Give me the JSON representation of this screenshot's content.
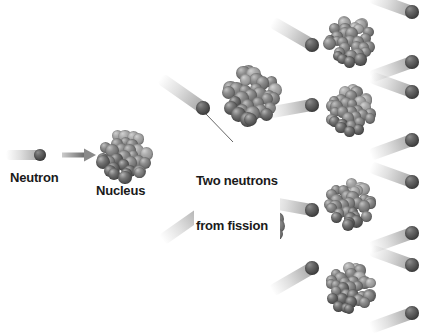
{
  "figure": {
    "background_color": "#ffffff",
    "width": 435,
    "height": 336
  },
  "palette": {
    "neutron_dark": "#4a4a4a",
    "neutron_highlight": "#8e8e8e",
    "nucleon_dark": "#5b5b5b",
    "nucleon_mid": "#777777",
    "nucleon_light": "#9a9a9a",
    "trail_color": "#b8b8b8",
    "arrow_color": "#8a8a8a",
    "leader_line_color": "#555555",
    "text_color": "#1a1a1a"
  },
  "labels": {
    "neutron": "Neutron",
    "nucleus": "Nucleus",
    "fission_line1": "Two neutrons",
    "fission_line2": "from fission"
  },
  "icons": {
    "arrow": "arrow-right-icon",
    "neutron": "neutron-particle-icon",
    "nucleus": "nucleus-cluster-icon",
    "trail": "motion-trail-icon",
    "leader": "leader-line-icon"
  },
  "diagram": {
    "generations": 3,
    "incoming_neutron": {
      "x": 40,
      "y": 155,
      "r": 6
    },
    "arrow": {
      "x1": 62,
      "y1": 155,
      "x2": 96,
      "y2": 155
    },
    "nuclei": [
      {
        "id": "gen1-nucleus",
        "cx": 125,
        "cy": 157,
        "r": 27,
        "generation": 1
      },
      {
        "id": "gen2-nucleus-top",
        "cx": 251,
        "cy": 96,
        "r": 29,
        "generation": 2
      },
      {
        "id": "gen2-nucleus-bottom",
        "cx": 255,
        "cy": 227,
        "r": 29,
        "generation": 2
      },
      {
        "id": "gen3-nucleus-1",
        "cx": 350,
        "cy": 41,
        "r": 25,
        "generation": 3
      },
      {
        "id": "gen3-nucleus-2",
        "cx": 350,
        "cy": 111,
        "r": 25,
        "generation": 3
      },
      {
        "id": "gen3-nucleus-3",
        "cx": 350,
        "cy": 204,
        "r": 25,
        "generation": 3
      },
      {
        "id": "gen3-nucleus-4",
        "cx": 350,
        "cy": 288,
        "r": 25,
        "generation": 3
      }
    ],
    "fission_neutrons_gen1": [
      {
        "id": "fission-neutron-up",
        "x": 203,
        "y": 108,
        "r": 7,
        "angle": -145,
        "trail_length": 52
      },
      {
        "id": "fission-neutron-down",
        "x": 205,
        "y": 210,
        "r": 7,
        "angle": 145,
        "trail_length": 52
      }
    ],
    "fission_neutrons_gen2": [
      {
        "id": "gen2-neutron-1",
        "x": 312,
        "y": 45,
        "r": 7,
        "angle": -150,
        "trail_length": 46
      },
      {
        "id": "gen2-neutron-2",
        "x": 312,
        "y": 105,
        "r": 7,
        "angle": 170,
        "trail_length": 46
      },
      {
        "id": "gen2-neutron-3",
        "x": 312,
        "y": 210,
        "r": 7,
        "angle": 190,
        "trail_length": 46
      },
      {
        "id": "gen2-neutron-4",
        "x": 312,
        "y": 268,
        "r": 7,
        "angle": 150,
        "trail_length": 46
      }
    ],
    "emitted_neutrons_gen3": [
      {
        "id": "gen3-neutron-1a",
        "x": 412,
        "y": 12,
        "r": 7,
        "angle": 200,
        "trail_length": 44
      },
      {
        "id": "gen3-neutron-1b",
        "x": 412,
        "y": 62,
        "r": 7,
        "angle": 160,
        "trail_length": 44
      },
      {
        "id": "gen3-neutron-2a",
        "x": 412,
        "y": 92,
        "r": 7,
        "angle": 200,
        "trail_length": 44
      },
      {
        "id": "gen3-neutron-2b",
        "x": 412,
        "y": 140,
        "r": 7,
        "angle": 160,
        "trail_length": 44
      },
      {
        "id": "gen3-neutron-3a",
        "x": 412,
        "y": 182,
        "r": 7,
        "angle": 200,
        "trail_length": 44
      },
      {
        "id": "gen3-neutron-3b",
        "x": 412,
        "y": 233,
        "r": 7,
        "angle": 160,
        "trail_length": 44
      },
      {
        "id": "gen3-neutron-4a",
        "x": 412,
        "y": 265,
        "r": 7,
        "angle": 200,
        "trail_length": 44
      },
      {
        "id": "gen3-neutron-4b",
        "x": 412,
        "y": 313,
        "r": 7,
        "angle": 160,
        "trail_length": 44
      }
    ],
    "leader_lines": [
      {
        "id": "leader-to-up-neutron",
        "x1": 233,
        "y1": 142,
        "x2": 206,
        "y2": 114
      },
      {
        "id": "leader-to-down-neutron",
        "x1": 219,
        "y1": 178,
        "x2": 203,
        "y2": 205
      }
    ],
    "label_positions": {
      "neutron": {
        "x": 10,
        "y": 170
      },
      "nucleus": {
        "x": 96,
        "y": 183
      },
      "fission": {
        "x": 194,
        "y": 142
      }
    }
  }
}
